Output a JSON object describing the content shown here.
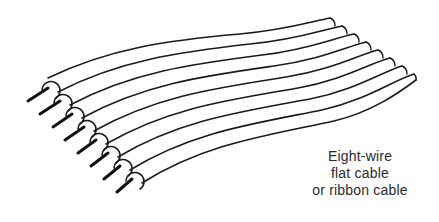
{
  "figure": {
    "wire_count": 8,
    "stroke_color": "#1a1a1a",
    "background": "#ffffff"
  },
  "caption": {
    "lines": [
      "Eight-wire",
      "flat cable",
      "or ribbon cable"
    ]
  }
}
